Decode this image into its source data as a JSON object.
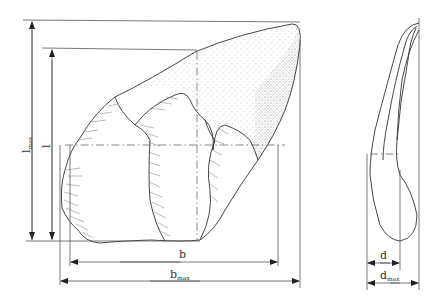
{
  "figure": {
    "dimensions": {
      "l_max": {
        "base": "l",
        "sub": "max"
      },
      "l": {
        "base": "l",
        "sub": ""
      },
      "b": {
        "base": "b",
        "sub": ""
      },
      "b_max": {
        "base": "b",
        "sub": "max"
      },
      "d": {
        "base": "d",
        "sub": ""
      },
      "d_max": {
        "base": "d",
        "sub": "max"
      }
    },
    "colors": {
      "line": "#555555",
      "outline": "#333333",
      "background": "#ffffff"
    }
  }
}
